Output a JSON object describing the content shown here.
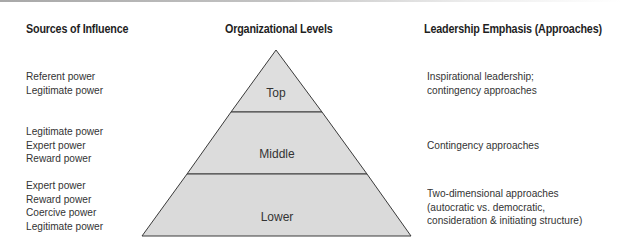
{
  "headers": {
    "sources": "Sources of Influence",
    "levels": "Organizational Levels",
    "emphasis": "Leadership Emphasis (Approaches)"
  },
  "tiers": [
    {
      "level": "Top",
      "sources": [
        "Referent power",
        "Legitimate power"
      ],
      "emphasis": [
        "Inspirational leadership;",
        "contingency approaches"
      ]
    },
    {
      "level": "Middle",
      "sources": [
        "Legitimate power",
        "Expert power",
        "Reward power"
      ],
      "emphasis": [
        "Contingency approaches"
      ]
    },
    {
      "level": "Lower",
      "sources": [
        "Expert power",
        "Reward power",
        "Coercive power",
        "Legitimate power"
      ],
      "emphasis": [
        "Two-dimensional approaches",
        "(autocratic vs. democratic,",
        "consideration & initiating structure)"
      ]
    }
  ],
  "colors": {
    "pyramid_fill": "#dedede",
    "pyramid_stroke": "#3a3a3a",
    "text": "#333333"
  }
}
